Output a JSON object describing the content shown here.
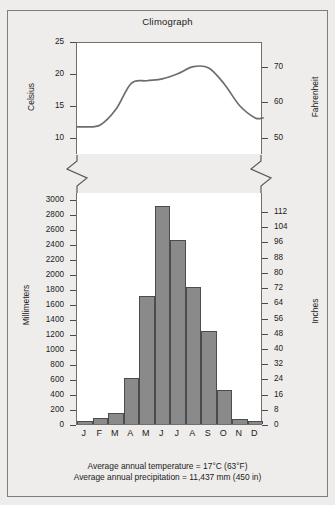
{
  "figure": {
    "title": "Climograph",
    "background_color": "#eeedeb",
    "plot_background_color": "#ffffff",
    "frame_color": "#7e7e7e"
  },
  "caption": {
    "line1": "Average annual temperature = 17°C (63°F)",
    "line2": "Average annual precipitation = 11,437 mm (450 in)"
  },
  "axes": {
    "temperature_left_title": "Celsius",
    "temperature_right_title": "Fahrenheit",
    "precipitation_left_title": "Millimeters",
    "precipitation_right_title": "Inches",
    "celsius_ticks": [
      "25",
      "20",
      "15",
      "10"
    ],
    "fahrenheit_ticks": [
      "70",
      "60",
      "50"
    ],
    "millimeter_ticks": [
      "3000",
      "2800",
      "2600",
      "2400",
      "2200",
      "2000",
      "1800",
      "1600",
      "1400",
      "1200",
      "1000",
      "800",
      "600",
      "400",
      "200",
      "0"
    ],
    "inch_ticks": [
      "112",
      "104",
      "96",
      "88",
      "80",
      "72",
      "64",
      "56",
      "48",
      "40",
      "32",
      "24",
      "16",
      "8",
      "0"
    ],
    "axis_break_marker": "zigzag-break-icon"
  },
  "chart_data": [
    {
      "type": "line",
      "title": "Climograph",
      "name": "temperature",
      "xlabel": "",
      "ylabel": "Celsius",
      "y2label": "Fahrenheit",
      "categories": [
        "J",
        "F",
        "M",
        "A",
        "M",
        "J",
        "J",
        "A",
        "S",
        "O",
        "N",
        "D"
      ],
      "values": [
        11.9,
        12.2,
        14.6,
        18.7,
        19.1,
        19.4,
        20.2,
        21.3,
        21.1,
        18.6,
        15.2,
        13.3
      ],
      "units": "°C",
      "ylim": [
        7.5,
        25
      ],
      "yticks": [
        10,
        15,
        20,
        25
      ],
      "y2lim": [
        45.5,
        77
      ],
      "y2ticks": [
        50,
        60,
        70
      ],
      "grid": false,
      "legend": "none",
      "line_color": "#6d6d6d"
    },
    {
      "type": "bar",
      "name": "precipitation",
      "xlabel": "",
      "ylabel": "Millimeters",
      "y2label": "Inches",
      "categories": [
        "J",
        "F",
        "M",
        "A",
        "M",
        "J",
        "J",
        "A",
        "S",
        "O",
        "N",
        "D"
      ],
      "values": [
        45,
        80,
        150,
        620,
        1715,
        2910,
        2465,
        1835,
        1240,
        455,
        65,
        35
      ],
      "units": "mm",
      "ylim": [
        0,
        3100
      ],
      "yticks": [
        0,
        200,
        400,
        600,
        800,
        1000,
        1200,
        1400,
        1600,
        1800,
        2000,
        2200,
        2400,
        2600,
        2800,
        3000
      ],
      "y2lim": [
        0,
        122
      ],
      "y2ticks": [
        0,
        8,
        16,
        24,
        32,
        40,
        48,
        56,
        64,
        72,
        80,
        88,
        96,
        104,
        112
      ],
      "grid": false,
      "legend": "none",
      "bar_color": "#8a8a8a",
      "bar_edge_color": "#4c4c4c"
    }
  ]
}
